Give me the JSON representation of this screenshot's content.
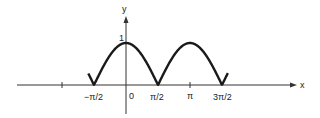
{
  "chart_data": {
    "type": "line",
    "title": "",
    "function": "y = |cos x|",
    "xlabel": "x",
    "ylabel": "y",
    "x_ticks": [
      "-π",
      "-π/2",
      "0",
      "π/2",
      "π",
      "3π/2"
    ],
    "x_tick_labels": [
      "−π/2",
      "0",
      "π/2",
      "π",
      "3π/2"
    ],
    "y_tick_labels": [
      "1"
    ],
    "x": [
      -1.85,
      -1.5708,
      -1.2,
      -0.8,
      -0.4,
      0,
      0.4,
      0.8,
      1.2,
      1.5708,
      2.0,
      2.4,
      2.8,
      3.1416,
      3.5,
      3.9,
      4.3,
      4.7124,
      5.0
    ],
    "series": [
      {
        "name": "|cos x|",
        "values": [
          0.28,
          0,
          0.36,
          0.7,
          0.92,
          1,
          0.92,
          0.7,
          0.36,
          0,
          0.42,
          0.74,
          0.94,
          1,
          0.94,
          0.73,
          0.4,
          0,
          0.28
        ]
      }
    ],
    "xlim": [
      -4.3,
      7.9
    ],
    "ylim": [
      -0.7,
      1.6
    ],
    "grid": false,
    "legend": "none"
  },
  "labels": {
    "x_axis": "x",
    "y_axis": "y",
    "y_one": "1",
    "neg_pi_half": "−π/2",
    "zero": "0",
    "pi_half": "π/2",
    "pi": "π",
    "three_pi_half": "3π/2"
  },
  "colors": {
    "curve": "#1a1a1a",
    "axis": "#333333"
  }
}
